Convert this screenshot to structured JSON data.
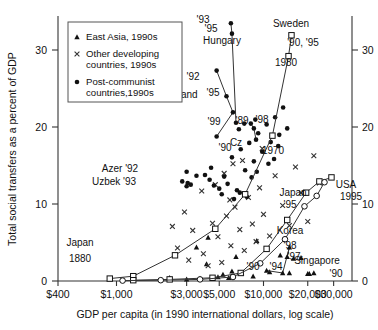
{
  "figure": {
    "xlabel": "GDP per capita (in 1990 international dollars, log scale)",
    "ylabel": "Total social transfers as a percent of GDP"
  },
  "legend": {
    "items": [
      {
        "marker": "triangle-marker",
        "label": "East Asia, 1990s"
      },
      {
        "marker": "cross-marker",
        "label": "Other developing"
      },
      {
        "marker": "none",
        "label": "countries, 1990s"
      },
      {
        "marker": "dot-marker",
        "label": "Post-communist"
      },
      {
        "marker": "none",
        "label": "countries,1990s"
      }
    ]
  },
  "axes": {
    "x_ticks": [
      "$400",
      "$1,000",
      "$3,000",
      "$5,000",
      "$10,000",
      "$20,000",
      "$30,000"
    ],
    "x_tick_values": [
      400,
      1000,
      3000,
      5000,
      10000,
      20000,
      30000
    ],
    "y_ticks_left": [
      "0",
      "10",
      "20",
      "30"
    ],
    "y_ticks_right": [
      "0",
      "10",
      "20",
      "30"
    ],
    "y_tick_values": [
      0,
      10,
      20,
      30
    ]
  },
  "chart_data": {
    "type": "scatter",
    "title": "",
    "xlabel": "GDP per capita (in 1990 international dollars, log scale)",
    "ylabel": "Total social transfers as a percent of GDP",
    "xscale": "log",
    "xlim": [
      400,
      40000
    ],
    "ylim": [
      0,
      33
    ],
    "grid": false,
    "legend_position": "top-left",
    "annotations": [
      {
        "text": "'93",
        "x": 203,
        "y": 23
      },
      {
        "text": "'95",
        "x": 211,
        "y": 32
      },
      {
        "text": "Hungary",
        "x": 222,
        "y": 44
      },
      {
        "text": "Sweden",
        "x": 291,
        "y": 27
      },
      {
        "text": "'90, '95",
        "x": 303,
        "y": 46
      },
      {
        "text": "1980",
        "x": 286,
        "y": 66
      },
      {
        "text": "'92",
        "x": 193,
        "y": 80
      },
      {
        "text": "Poland",
        "x": 182,
        "y": 98
      },
      {
        "text": "'95",
        "x": 213,
        "y": 96
      },
      {
        "text": "'99",
        "x": 214,
        "y": 125
      },
      {
        "text": "'89",
        "x": 242,
        "y": 124
      },
      {
        "text": "'98",
        "x": 262,
        "y": 123
      },
      {
        "text": "Cz",
        "x": 236,
        "y": 146
      },
      {
        "text": "1970",
        "x": 273,
        "y": 154
      },
      {
        "text": "'90",
        "x": 225,
        "y": 151
      },
      {
        "text": "Azer '92",
        "x": 120,
        "y": 172
      },
      {
        "text": "Uzbek '93",
        "x": 114,
        "y": 185
      },
      {
        "text": "Japan",
        "x": 293,
        "y": 196
      },
      {
        "text": "USA",
        "x": 346,
        "y": 188
      },
      {
        "text": "1995",
        "x": 351,
        "y": 200
      },
      {
        "text": "'95",
        "x": 290,
        "y": 208
      },
      {
        "text": "Korea",
        "x": 290,
        "y": 234
      },
      {
        "text": "'98",
        "x": 290,
        "y": 249
      },
      {
        "text": "'97",
        "x": 294,
        "y": 260
      },
      {
        "text": "'90",
        "x": 253,
        "y": 270
      },
      {
        "text": "'94",
        "x": 276,
        "y": 270
      },
      {
        "text": "Singapore",
        "x": 317,
        "y": 264
      },
      {
        "text": "'90",
        "x": 336,
        "y": 277
      },
      {
        "text": "Japan",
        "x": 80,
        "y": 246
      },
      {
        "text": "1880",
        "x": 80,
        "y": 262
      }
    ],
    "series": [
      {
        "name": "East Asia, 1990s",
        "marker": "triangle",
        "points": [
          [
            2300,
            0.4
          ],
          [
            3000,
            0.2
          ],
          [
            3700,
            0.3
          ],
          [
            4100,
            2.1
          ],
          [
            4900,
            0.5
          ],
          [
            5300,
            0.8
          ],
          [
            5800,
            0.4
          ],
          [
            6100,
            1.2
          ],
          [
            6500,
            3.0
          ],
          [
            7100,
            1.0
          ],
          [
            3500,
            4.2
          ],
          [
            4200,
            5.4
          ],
          [
            8500,
            0.6
          ],
          [
            11000,
            1.1
          ],
          [
            13000,
            3.2
          ],
          [
            9000,
            5.0
          ],
          [
            15000,
            1.0
          ],
          [
            16000,
            2.8
          ],
          [
            18000,
            2.9
          ],
          [
            22000,
            1.0
          ],
          [
            20000,
            0.9
          ]
        ]
      },
      {
        "name": "Other developing countries, 1990s",
        "marker": "cross",
        "points": [
          [
            2600,
            4.1
          ],
          [
            3100,
            2.6
          ],
          [
            3300,
            6.3
          ],
          [
            3900,
            3.4
          ],
          [
            4200,
            1.9
          ],
          [
            4500,
            7.2
          ],
          [
            4900,
            5.5
          ],
          [
            5200,
            2.3
          ],
          [
            5600,
            8.1
          ],
          [
            6000,
            4.4
          ],
          [
            6400,
            9.2
          ],
          [
            6900,
            6.4
          ],
          [
            7400,
            3.8
          ],
          [
            7900,
            10.4
          ],
          [
            8400,
            7.1
          ],
          [
            8900,
            4.9
          ],
          [
            9400,
            11.6
          ],
          [
            10000,
            8.3
          ],
          [
            11000,
            5.6
          ],
          [
            12000,
            13.1
          ],
          [
            13500,
            9.4
          ],
          [
            15000,
            6.9
          ],
          [
            16500,
            14.2
          ],
          [
            18000,
            11.0
          ],
          [
            20000,
            7.4
          ],
          [
            22000,
            15.6
          ],
          [
            24000,
            12.2
          ],
          [
            4700,
            12.0
          ],
          [
            5400,
            13.4
          ],
          [
            6200,
            14.6
          ],
          [
            3800,
            11.2
          ],
          [
            5900,
            10.1
          ],
          [
            7200,
            15.0
          ],
          [
            9800,
            16.5
          ],
          [
            2900,
            8.6
          ],
          [
            2400,
            6.8
          ]
        ]
      },
      {
        "name": "Post-communist countries, 1990s",
        "marker": "dot",
        "points": [
          [
            5400,
            13.0
          ],
          [
            5700,
            12.1
          ],
          [
            6100,
            15.4
          ],
          [
            6600,
            11.3
          ],
          [
            7000,
            16.4
          ],
          [
            7500,
            13.8
          ],
          [
            8000,
            17.2
          ],
          [
            8600,
            14.9
          ],
          [
            9200,
            18.4
          ],
          [
            9800,
            16.1
          ],
          [
            10500,
            19.5
          ],
          [
            11200,
            17.3
          ],
          [
            12000,
            20.4
          ],
          [
            12800,
            18.2
          ],
          [
            13600,
            21.6
          ],
          [
            14500,
            19.0
          ],
          [
            5000,
            11.5
          ],
          [
            5200,
            10.8
          ],
          [
            4600,
            11.9
          ],
          [
            4300,
            12.6
          ],
          [
            6300,
            10.2
          ],
          [
            6900,
            11.0
          ],
          [
            7700,
            10.5
          ],
          [
            8300,
            12.9
          ],
          [
            9000,
            13.6
          ],
          [
            4000,
            13.2
          ],
          [
            4400,
            14.1
          ],
          [
            10800,
            14.6
          ],
          [
            11800,
            15.2
          ],
          [
            12600,
            16.8
          ],
          [
            3500,
            13.1
          ],
          [
            3200,
            12.0
          ],
          [
            6800,
            18.9
          ],
          [
            7400,
            19.6
          ],
          [
            8800,
            20.1
          ],
          [
            3000,
            11.8
          ],
          [
            2800,
            12.4
          ]
        ]
      },
      {
        "name": "Azerbaijan 1992",
        "marker": "dot",
        "points": [
          [
            3000,
            13.6
          ]
        ]
      },
      {
        "name": "Uzbekistan 1993",
        "marker": "dot",
        "points": [
          [
            3050,
            12.2
          ]
        ]
      },
      {
        "name": "Poland",
        "marker": "dot-line",
        "labels": [
          "'92",
          "'95",
          "'99",
          "'90"
        ],
        "points": [
          [
            4800,
            26.2
          ],
          [
            5600,
            23.0
          ],
          [
            6200,
            21.0
          ],
          [
            4800,
            18.0
          ]
        ]
      },
      {
        "name": "Hungary",
        "marker": "dot-line",
        "labels": [
          "'93",
          "'95",
          "'89"
        ],
        "points": [
          [
            6000,
            32.1
          ],
          [
            6100,
            30.8
          ],
          [
            6500,
            19.7
          ]
        ]
      },
      {
        "name": "Czech Republic",
        "marker": "dot-line",
        "labels": [
          "'89",
          "'98"
        ],
        "points": [
          [
            8200,
            19.6
          ],
          [
            8600,
            19.0
          ],
          [
            8900,
            17.6
          ]
        ]
      },
      {
        "name": "Sweden",
        "marker": "square-line",
        "labels": [
          "'90, '95",
          "1980",
          "1970"
        ],
        "points": [
          [
            15500,
            30.6
          ],
          [
            14800,
            28.0
          ],
          [
            11500,
            18.1
          ],
          [
            7500,
            10.8
          ],
          [
            4700,
            6.5
          ],
          [
            2500,
            3.2
          ],
          [
            1300,
            0.6
          ],
          [
            900,
            0.3
          ]
        ]
      },
      {
        "name": "USA",
        "marker": "square-line",
        "labels": [
          "1995"
        ],
        "points": [
          [
            29000,
            12.9
          ],
          [
            24000,
            12.4
          ],
          [
            19500,
            11.0
          ],
          [
            14500,
            7.6
          ],
          [
            10500,
            4.0
          ],
          [
            7000,
            1.0
          ],
          [
            4500,
            0.4
          ],
          [
            2300,
            0.2
          ],
          [
            1300,
            0.1
          ]
        ]
      },
      {
        "name": "Japan",
        "marker": "circle-line",
        "labels": [
          "'95",
          "1880"
        ],
        "points": [
          [
            26000,
            12.3
          ],
          [
            23000,
            10.6
          ],
          [
            19000,
            9.3
          ],
          [
            14000,
            5.2
          ],
          [
            9500,
            2.2
          ],
          [
            6200,
            0.5
          ],
          [
            3700,
            0.2
          ],
          [
            2000,
            0.1
          ],
          [
            1100,
            0.05
          ]
        ]
      },
      {
        "name": "Korea",
        "marker": "triangle-line",
        "labels": [
          "'98",
          "'97",
          "'90",
          "'94"
        ],
        "points": [
          [
            10500,
            1.3
          ],
          [
            13500,
            1.0
          ],
          [
            15000,
            4.2
          ],
          [
            14500,
            3.0
          ]
        ]
      },
      {
        "name": "Singapore",
        "marker": "triangle-point",
        "labels": [
          "'90"
        ],
        "points": [
          [
            20500,
            0.9
          ]
        ]
      }
    ]
  }
}
